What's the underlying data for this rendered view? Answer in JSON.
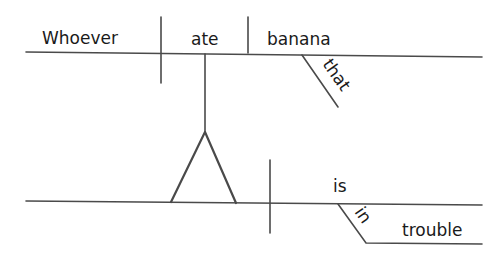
{
  "diagram": {
    "type": "reed-kellogg-sentence-diagram",
    "main_clause": {
      "subject_clause": {
        "subject": "Whoever",
        "verb": "ate",
        "direct_object": "banana",
        "modifier_of_object": "that"
      },
      "predicate": {
        "verb": "is",
        "preposition": "in",
        "object_of_preposition": "trouble"
      }
    },
    "colors": {
      "line": "#4a4a4a",
      "text": "#1a1a1a",
      "background": "#ffffff"
    }
  }
}
